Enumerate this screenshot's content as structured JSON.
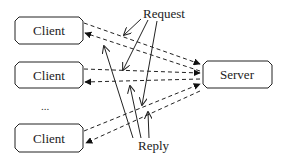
{
  "diagram": {
    "nodes": [
      {
        "id": "client-1",
        "label": "Client"
      },
      {
        "id": "client-2",
        "label": "Client"
      },
      {
        "id": "client-3",
        "label": "Client"
      },
      {
        "id": "server",
        "label": "Server"
      }
    ],
    "ellipsis": "...",
    "annotations": {
      "request": "Request",
      "reply": "Reply"
    },
    "edges": [
      {
        "from": "client-1",
        "to": "server",
        "style": "dashed",
        "kind": "request"
      },
      {
        "from": "server",
        "to": "client-1",
        "style": "dashed",
        "kind": "reply"
      },
      {
        "from": "client-2",
        "to": "server",
        "style": "dashed",
        "kind": "request"
      },
      {
        "from": "server",
        "to": "client-2",
        "style": "dashed",
        "kind": "reply"
      },
      {
        "from": "client-3",
        "to": "server",
        "style": "dashed",
        "kind": "request"
      },
      {
        "from": "server",
        "to": "client-3",
        "style": "dashed",
        "kind": "reply"
      }
    ],
    "colors": {
      "stroke": "#222222",
      "background": "#ffffff"
    }
  }
}
